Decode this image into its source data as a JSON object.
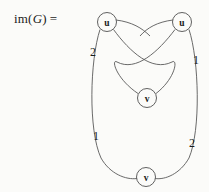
{
  "figure": {
    "label_prefix": "im(",
    "label_var": "G",
    "label_suffix": ")",
    "label_equals": "=",
    "stroke_color": "#595959",
    "node_stroke_color": "#4f4f4f",
    "text_color": "#1b1b1b",
    "background_color": "#fbfbf9"
  },
  "graph": {
    "nodes": [
      {
        "id": "u-top-left",
        "label": "u",
        "cx": 107,
        "cy": 22,
        "r": 9.5
      },
      {
        "id": "u-top-right",
        "label": "u",
        "cx": 182,
        "cy": 22,
        "r": 9.5
      },
      {
        "id": "v-middle",
        "label": "v",
        "cx": 147,
        "cy": 98,
        "r": 9.5
      },
      {
        "id": "v-bottom",
        "label": "v",
        "cx": 146,
        "cy": 177,
        "r": 9.5
      }
    ],
    "edges": [
      {
        "id": "edge-uleft-vmid",
        "from": "u-top-left",
        "to": "v-middle",
        "label": ""
      },
      {
        "id": "edge-uright-vmid",
        "from": "u-top-right",
        "to": "v-middle",
        "label": ""
      },
      {
        "id": "edge-uleft-vbottom",
        "from": "u-top-left",
        "to": "v-bottom",
        "label": ""
      },
      {
        "id": "edge-uright-vbottom",
        "from": "u-top-right",
        "to": "v-bottom",
        "label": ""
      }
    ],
    "edge_labels": [
      {
        "id": "label-upper-left",
        "text": "2",
        "x": 93,
        "y": 52
      },
      {
        "id": "label-upper-right",
        "text": "1",
        "x": 196,
        "y": 60
      },
      {
        "id": "label-lower-left",
        "text": "1",
        "x": 96,
        "y": 136
      },
      {
        "id": "label-lower-right",
        "text": "2",
        "x": 192,
        "y": 143
      }
    ]
  }
}
